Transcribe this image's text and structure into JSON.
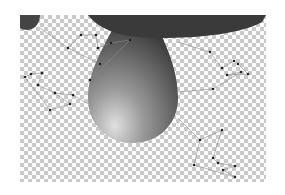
{
  "viewport": {
    "background": "transparency-checkerboard",
    "checker_colors": [
      "#ffffff",
      "#c9c9c9"
    ]
  },
  "shapes": {
    "drop": {
      "fill_dark": "#3e3e3e",
      "fill_light": "#d8d8d8"
    },
    "top_cap": {
      "fill": "#3a3a3a"
    },
    "corner_blob": {
      "fill": "#444444"
    }
  },
  "rigs": [
    {
      "name": "top-left-rig",
      "points": [
        [
          68,
          48
        ],
        [
          81,
          35
        ],
        [
          96,
          35
        ],
        [
          98,
          48
        ],
        [
          111,
          43
        ],
        [
          130,
          40
        ],
        [
          100,
          64
        ],
        [
          90,
          80
        ]
      ]
    },
    {
      "name": "left-rig",
      "points": [
        [
          25,
          77
        ],
        [
          31,
          74
        ],
        [
          42,
          73
        ],
        [
          38,
          85
        ],
        [
          55,
          93
        ],
        [
          70,
          104
        ],
        [
          50,
          110
        ],
        [
          73,
          95
        ]
      ]
    },
    {
      "name": "right-rig",
      "points": [
        [
          210,
          52
        ],
        [
          222,
          68
        ],
        [
          234,
          61
        ],
        [
          238,
          64
        ],
        [
          248,
          74
        ],
        [
          227,
          75
        ],
        [
          241,
          72
        ],
        [
          213,
          89
        ]
      ]
    },
    {
      "name": "bottom-right-rig",
      "points": [
        [
          200,
          140
        ],
        [
          222,
          130
        ],
        [
          213,
          158
        ],
        [
          218,
          163
        ],
        [
          235,
          166
        ],
        [
          223,
          170
        ],
        [
          235,
          177
        ],
        [
          194,
          165
        ]
      ]
    }
  ]
}
